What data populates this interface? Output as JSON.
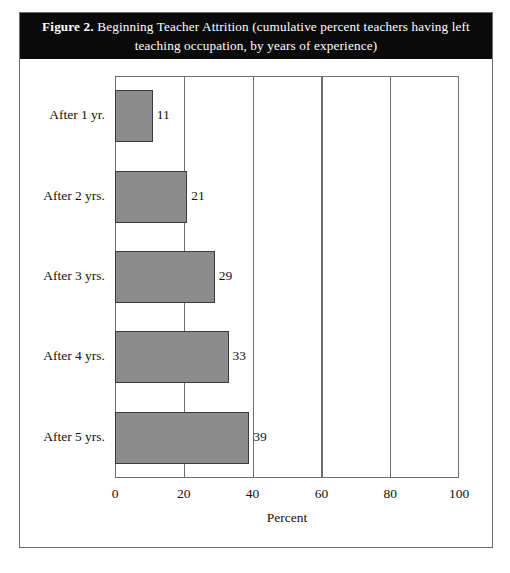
{
  "figure": {
    "label": "Figure 2.",
    "caption": "Beginning Teacher Attrition (cumulative percent teachers having left teaching occupation, by years of experience)",
    "band_color": "#0a0a0a",
    "frame_color": "#6e6e6e"
  },
  "chart_data": {
    "type": "bar",
    "orientation": "horizontal",
    "title": "Beginning Teacher Attrition (cumulative percent teachers having left teaching occupation, by years of experience)",
    "categories": [
      "After 1 yr.",
      "After 2 yrs.",
      "After 3 yrs.",
      "After 4 yrs.",
      "After 5 yrs."
    ],
    "values": [
      11,
      21,
      29,
      33,
      39
    ],
    "data_labels": [
      "11",
      "21",
      "29",
      "33",
      "39"
    ],
    "xlabel": "Percent",
    "ylabel": "",
    "xlim": [
      0,
      100
    ],
    "xticks": [
      0,
      20,
      40,
      60,
      80,
      100
    ],
    "xtick_labels": [
      "0",
      "20",
      "40",
      "60",
      "80",
      "100"
    ],
    "grid": "vertical",
    "legend": null,
    "bar_color": "#8c8c8c",
    "bar_edge_color": "#3b3b3b"
  }
}
